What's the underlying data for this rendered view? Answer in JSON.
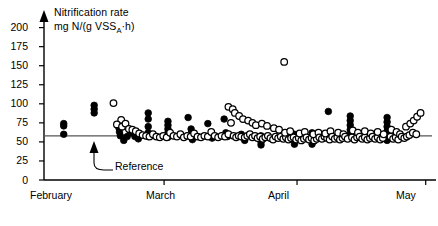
{
  "chart_data": {
    "type": "scatter",
    "title": "",
    "ylabel_line1": "Nitrification rate",
    "ylabel_line2_pre": "mg N/(g VSS",
    "ylabel_line2_sub": "A",
    "ylabel_line2_post": "·h)",
    "xlabel": "",
    "ylim": [
      0,
      210
    ],
    "yticks": [
      0,
      25,
      50,
      75,
      100,
      125,
      150,
      175,
      200
    ],
    "ytick_labels": [
      "0",
      "25",
      "50",
      "75",
      "100",
      "125",
      "150",
      "175",
      "200"
    ],
    "xlim": [
      0,
      90
    ],
    "xticks": [
      0,
      28,
      59,
      89
    ],
    "xtick_labels": [
      "February",
      "March",
      "April",
      "May"
    ],
    "grid": false,
    "legend_position": "none",
    "reference_line": {
      "label": "Reference",
      "value": 58,
      "color": "#555555"
    },
    "series": [
      {
        "name": "filled",
        "marker": "filled-circle",
        "color": "#000000",
        "points": [
          [
            4.6,
            74
          ],
          [
            4.6,
            71
          ],
          [
            4.6,
            60
          ],
          [
            11.7,
            98
          ],
          [
            11.7,
            93
          ],
          [
            11.7,
            88
          ],
          [
            17.5,
            68
          ],
          [
            17.6,
            63
          ],
          [
            17.8,
            58
          ],
          [
            18.6,
            52
          ],
          [
            19.4,
            57
          ],
          [
            20.2,
            62
          ],
          [
            21.2,
            57
          ],
          [
            22.0,
            54
          ],
          [
            24.3,
            88
          ],
          [
            24.3,
            80
          ],
          [
            24.3,
            70
          ],
          [
            24.3,
            62
          ],
          [
            24.3,
            57
          ],
          [
            28.9,
            77
          ],
          [
            28.9,
            72
          ],
          [
            28.9,
            67
          ],
          [
            28.9,
            62
          ],
          [
            28.9,
            56
          ],
          [
            33.6,
            82
          ],
          [
            34.3,
            67
          ],
          [
            34.4,
            62
          ],
          [
            34.4,
            57
          ],
          [
            34.6,
            53
          ],
          [
            38.2,
            74
          ],
          [
            39.0,
            59
          ],
          [
            39.2,
            55
          ],
          [
            42.0,
            80
          ],
          [
            42.4,
            62
          ],
          [
            42.8,
            57
          ],
          [
            46.0,
            60
          ],
          [
            46.4,
            56
          ],
          [
            46.8,
            52
          ],
          [
            50.6,
            58
          ],
          [
            50.6,
            54
          ],
          [
            50.6,
            50
          ],
          [
            50.6,
            46
          ],
          [
            58.4,
            60
          ],
          [
            58.4,
            56
          ],
          [
            58.4,
            52
          ],
          [
            58.4,
            47
          ],
          [
            62.5,
            62
          ],
          [
            62.5,
            57
          ],
          [
            62.5,
            52
          ],
          [
            62.5,
            47
          ],
          [
            66.3,
            90
          ],
          [
            71.4,
            84
          ],
          [
            71.4,
            78
          ],
          [
            71.4,
            72
          ],
          [
            71.4,
            66
          ],
          [
            71.4,
            60
          ],
          [
            80.0,
            82
          ],
          [
            80.0,
            76
          ],
          [
            80.0,
            70
          ],
          [
            80.0,
            64
          ],
          [
            80.0,
            58
          ],
          [
            80.0,
            52
          ]
        ]
      },
      {
        "name": "open",
        "marker": "open-circle",
        "color": "#000000",
        "points": [
          [
            16.2,
            101
          ],
          [
            18.0,
            79
          ],
          [
            17.0,
            73
          ],
          [
            18.2,
            70
          ],
          [
            19.0,
            74
          ],
          [
            19.8,
            67
          ],
          [
            20.6,
            66
          ],
          [
            21.4,
            64
          ],
          [
            22.2,
            61
          ],
          [
            23.0,
            59
          ],
          [
            23.8,
            58
          ],
          [
            24.6,
            57
          ],
          [
            25.4,
            60
          ],
          [
            26.2,
            57
          ],
          [
            27.0,
            56
          ],
          [
            27.8,
            58
          ],
          [
            28.6,
            56
          ],
          [
            29.4,
            62
          ],
          [
            30.2,
            58
          ],
          [
            31.0,
            57
          ],
          [
            31.8,
            60
          ],
          [
            32.6,
            56
          ],
          [
            33.4,
            58
          ],
          [
            34.2,
            57
          ],
          [
            35.0,
            61
          ],
          [
            35.8,
            57
          ],
          [
            36.6,
            56
          ],
          [
            37.4,
            58
          ],
          [
            38.2,
            57
          ],
          [
            39.0,
            63
          ],
          [
            39.8,
            58
          ],
          [
            40.6,
            56
          ],
          [
            41.4,
            58
          ],
          [
            42.2,
            57
          ],
          [
            43.0,
            60
          ],
          [
            43.6,
            75
          ],
          [
            44.2,
            58
          ],
          [
            44.8,
            56
          ],
          [
            45.4,
            58
          ],
          [
            43.0,
            96
          ],
          [
            44.0,
            93
          ],
          [
            44.5,
            88
          ],
          [
            45.5,
            84
          ],
          [
            46.4,
            80
          ],
          [
            46.0,
            57
          ],
          [
            46.8,
            56
          ],
          [
            47.4,
            58
          ],
          [
            48.0,
            60
          ],
          [
            48.6,
            56
          ],
          [
            47.6,
            78
          ],
          [
            48.6,
            75
          ],
          [
            49.4,
            72
          ],
          [
            49.2,
            58
          ],
          [
            49.8,
            55
          ],
          [
            50.4,
            57
          ],
          [
            51.0,
            54
          ],
          [
            51.6,
            56
          ],
          [
            50.8,
            74
          ],
          [
            52.0,
            71
          ],
          [
            52.2,
            58
          ],
          [
            52.8,
            55
          ],
          [
            53.4,
            53
          ],
          [
            54.0,
            57
          ],
          [
            54.6,
            55
          ],
          [
            53.6,
            68
          ],
          [
            54.8,
            66
          ],
          [
            55.2,
            57
          ],
          [
            55.8,
            54
          ],
          [
            56.4,
            56
          ],
          [
            57.0,
            53
          ],
          [
            57.6,
            55
          ],
          [
            56.2,
            62
          ],
          [
            57.4,
            64
          ],
          [
            58.2,
            56
          ],
          [
            58.8,
            53
          ],
          [
            59.4,
            55
          ],
          [
            60.0,
            52
          ],
          [
            60.6,
            54
          ],
          [
            59.6,
            61
          ],
          [
            60.8,
            63
          ],
          [
            61.2,
            56
          ],
          [
            61.8,
            53
          ],
          [
            62.4,
            55
          ],
          [
            63.0,
            52
          ],
          [
            63.6,
            54
          ],
          [
            62.8,
            60
          ],
          [
            64.0,
            62
          ],
          [
            64.2,
            56
          ],
          [
            64.8,
            54
          ],
          [
            65.4,
            57
          ],
          [
            66.0,
            55
          ],
          [
            66.6,
            53
          ],
          [
            65.6,
            61
          ],
          [
            66.8,
            64
          ],
          [
            67.2,
            57
          ],
          [
            67.8,
            54
          ],
          [
            68.4,
            56
          ],
          [
            69.0,
            53
          ],
          [
            69.6,
            55
          ],
          [
            68.6,
            62
          ],
          [
            69.8,
            60
          ],
          [
            70.2,
            57
          ],
          [
            70.8,
            54
          ],
          [
            71.8,
            56
          ],
          [
            72.4,
            53
          ],
          [
            73.0,
            56
          ],
          [
            72.0,
            65
          ],
          [
            73.2,
            62
          ],
          [
            73.6,
            57
          ],
          [
            74.2,
            54
          ],
          [
            74.8,
            56
          ],
          [
            75.4,
            53
          ],
          [
            76.0,
            55
          ],
          [
            74.8,
            64
          ],
          [
            76.2,
            61
          ],
          [
            76.6,
            57
          ],
          [
            77.2,
            54
          ],
          [
            77.8,
            56
          ],
          [
            78.4,
            53
          ],
          [
            79.0,
            55
          ],
          [
            77.8,
            63
          ],
          [
            79.2,
            60
          ],
          [
            80.8,
            57
          ],
          [
            81.4,
            54
          ],
          [
            82.0,
            56
          ],
          [
            82.6,
            53
          ],
          [
            81.0,
            66
          ],
          [
            82.2,
            63
          ],
          [
            83.0,
            60
          ],
          [
            83.4,
            57
          ],
          [
            84.0,
            55
          ],
          [
            84.6,
            57
          ],
          [
            85.2,
            59
          ],
          [
            84.4,
            70
          ],
          [
            85.4,
            74
          ],
          [
            86.2,
            78
          ],
          [
            87.0,
            83
          ],
          [
            87.8,
            88
          ],
          [
            86.0,
            62
          ],
          [
            86.8,
            60
          ],
          [
            56.0,
            155
          ]
        ]
      }
    ]
  },
  "annotations": {
    "reference_text": "Reference"
  }
}
